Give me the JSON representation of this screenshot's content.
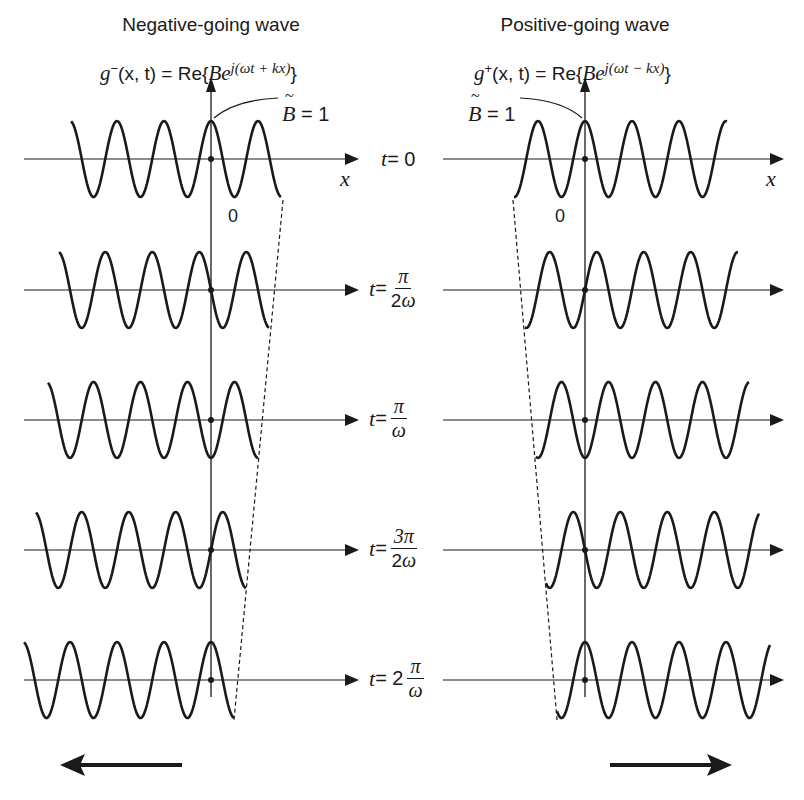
{
  "panels": {
    "left": {
      "title": "Negative-going wave",
      "formula": {
        "func": "g",
        "sign_sup": "−",
        "args": "(x, t) = Re{",
        "B": "B",
        "e": "e",
        "exponent": "j(ωt + kx)",
        "close": "}"
      },
      "amplitude_label": {
        "symbol": "B",
        "rest": " = 1"
      },
      "x_axis_label": "x",
      "origin_label": "0",
      "direction": "left"
    },
    "right": {
      "title": "Positive-going wave",
      "formula": {
        "func": "g",
        "sign_sup": "+",
        "args": "(x, t) = Re{",
        "B": "B",
        "e": "e",
        "exponent": "j(ωt − kx)",
        "close": "}"
      },
      "amplitude_label": {
        "symbol": "B",
        "rest": " = 1"
      },
      "x_axis_label": "x",
      "origin_label": "0",
      "direction": "right"
    }
  },
  "time_labels": [
    {
      "t": "t",
      "eq": " = ",
      "whole": "0",
      "num": "",
      "den": ""
    },
    {
      "t": "t",
      "eq": " = ",
      "whole": "",
      "num": "π",
      "den": "2ω"
    },
    {
      "t": "t",
      "eq": " = ",
      "whole": "",
      "num": "π",
      "den": "ω"
    },
    {
      "t": "t",
      "eq": " = ",
      "whole": "",
      "num": "3π",
      "den": "2ω"
    },
    {
      "t": "t",
      "eq": " = 2",
      "whole": "",
      "num": "π",
      "den": "ω"
    }
  ],
  "chart_data": {
    "type": "line",
    "amplitude": 1,
    "time_steps": [
      "0",
      "π/(2ω)",
      "π/ω",
      "3π/(2ω)",
      "2π/ω"
    ],
    "series": [
      {
        "name": "g−(x,t) = Re{B e^{j(ωt + kx)}}",
        "direction": "negative x",
        "phase_shift_per_step_wavelengths": 0.25,
        "value_at_origin": [
          1,
          0,
          -1,
          0,
          1
        ]
      },
      {
        "name": "g+(x,t) = Re{B e^{j(ωt − kx)}}",
        "direction": "positive x",
        "phase_shift_per_step_wavelengths": 0.25,
        "value_at_origin": [
          1,
          0,
          -1,
          0,
          1
        ]
      }
    ],
    "xlabel": "x",
    "annotations": [
      "B = 1",
      "0",
      "dashed line tracks wave end",
      "arrow indicates propagation direction"
    ]
  },
  "style": {
    "ink": "#1a1a1a"
  }
}
